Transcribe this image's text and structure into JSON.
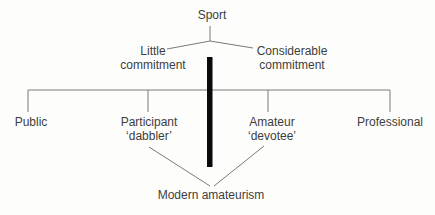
{
  "diagram": {
    "root": {
      "label": "Sport"
    },
    "branches": {
      "left": {
        "line1": "Little",
        "line2": "commitment"
      },
      "right": {
        "line1": "Considerable",
        "line2": "commitment"
      }
    },
    "spectrum": [
      {
        "label": "Public",
        "sublabel": ""
      },
      {
        "label": "Participant",
        "sublabel": "‘dabbler’"
      },
      {
        "label": "Amateur",
        "sublabel": "‘devotee’"
      },
      {
        "label": "Professional",
        "sublabel": ""
      }
    ],
    "result": {
      "label": "Modern amateurism"
    },
    "colors": {
      "background": "#fdfdfc",
      "line": "#7a7a7a",
      "bar": "#0a0a0a",
      "text": "#3d3d3d"
    }
  }
}
